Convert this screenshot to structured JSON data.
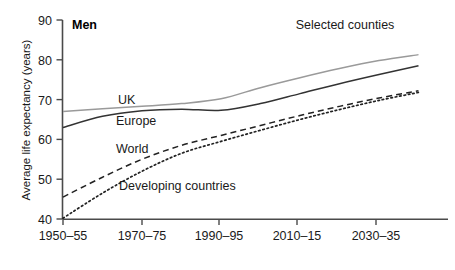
{
  "chart_data": {
    "type": "line",
    "title": "Selected counties",
    "panel_label": "Men",
    "xlabel": "",
    "ylabel": "Average life expectancy (years)",
    "categories": [
      "1950–55",
      "1960–65",
      "1970–75",
      "1980–85",
      "1990–95",
      "2000–05",
      "2010–15",
      "2020–25",
      "2030–35",
      "2040–45"
    ],
    "xtick_labels": [
      "1950–55",
      "1970–75",
      "1990–95",
      "2010–15",
      "2030–35"
    ],
    "ytick_labels": [
      "40",
      "50",
      "60",
      "70",
      "80",
      "90"
    ],
    "ylim": [
      40,
      90
    ],
    "xlim": [
      0,
      9.5
    ],
    "grid": false,
    "legend": "inline-labels",
    "series": [
      {
        "name": "UK",
        "style": "solid",
        "color": "#9a9a9a",
        "x": [
          "1950–55",
          "1960–65",
          "1970–75",
          "1980–85",
          "1990–95",
          "2000–05",
          "2010–15",
          "2020–25",
          "2030–35",
          "2040–45"
        ],
        "values": [
          67.0,
          67.7,
          68.3,
          69.0,
          70.2,
          73.0,
          75.5,
          77.8,
          79.8,
          81.3
        ]
      },
      {
        "name": "Europe",
        "style": "solid",
        "color": "#333333",
        "x": [
          "1950–55",
          "1960–65",
          "1970–75",
          "1980–85",
          "1990–95",
          "2000–05",
          "2010–15",
          "2020–25",
          "2030–35",
          "2040–45"
        ],
        "values": [
          63.0,
          65.8,
          67.2,
          67.6,
          67.3,
          69.0,
          71.5,
          74.0,
          76.3,
          78.5
        ]
      },
      {
        "name": "World",
        "style": "dashed",
        "color": "#222222",
        "x": [
          "1950–55",
          "1960–65",
          "1970–75",
          "1980–85",
          "1990–95",
          "2000–05",
          "2010–15",
          "2020–25",
          "2030–35",
          "2040–45"
        ],
        "values": [
          45.5,
          50.5,
          55.0,
          58.5,
          61.0,
          63.5,
          66.0,
          68.3,
          70.4,
          72.2
        ]
      },
      {
        "name": "Developing countries",
        "style": "dotted",
        "color": "#222222",
        "x": [
          "1950–55",
          "1960–65",
          "1970–75",
          "1980–85",
          "1990–95",
          "2000–05",
          "2010–15",
          "2020–25",
          "2030–35",
          "2040–45"
        ],
        "values": [
          40.2,
          46.5,
          52.0,
          56.5,
          59.5,
          62.3,
          65.0,
          67.5,
          69.8,
          71.8
        ]
      }
    ],
    "annotations": [
      {
        "name": "UK",
        "x": 118,
        "y": 104
      },
      {
        "name": "Europe",
        "x": 116,
        "y": 125
      },
      {
        "name": "World",
        "x": 116,
        "y": 153
      },
      {
        "name": "Developing countries",
        "x": 119,
        "y": 190
      }
    ]
  }
}
